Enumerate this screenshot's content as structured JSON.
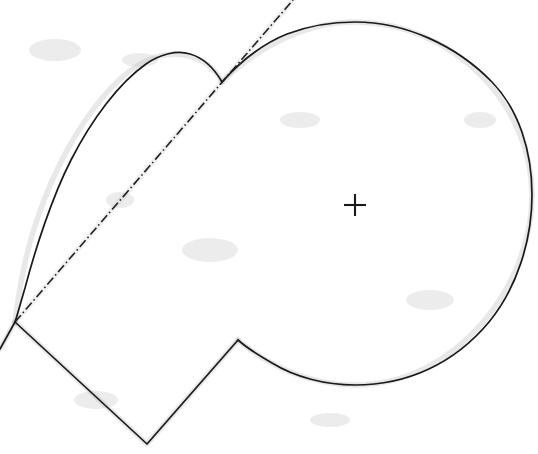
{
  "figure": {
    "title": "Limacon with tangent line, chord polyline and centre marker",
    "background_color": "#ffffff",
    "ink_color": "#1a1a1a",
    "halo_color": "#b9b9b9",
    "width": 538,
    "height": 454,
    "elements": [
      {
        "name": "large-circle-arc",
        "kind": "arc",
        "style": "solid",
        "description": "Large outer lobe running clockwise from the cusp at upper-left, over the top, down the right side and along the bottom to the polyline peak."
      },
      {
        "name": "small-lobe-arc",
        "kind": "arc",
        "style": "solid",
        "description": "Smaller inner lobe from the left vertex up over its apex and back down to the cusp."
      },
      {
        "name": "tangent-dash-dot-line",
        "kind": "line",
        "style": "dash-dot",
        "description": "Dash-dot straight line from the left vertex through the cusp continuing off the top edge."
      },
      {
        "name": "chord-polyline",
        "kind": "polyline",
        "style": "solid",
        "description": "Straight chain: left vertex down-right to the bottom V, up-right to the peak, then curving right into the big lobe."
      },
      {
        "name": "left-stub-segment",
        "kind": "line",
        "style": "solid",
        "description": "Short solid segment running from the left vertex down-left off the left edge."
      },
      {
        "name": "centre-cross-marker",
        "kind": "marker",
        "style": "plus",
        "description": "Small plus / cross marker inside the large lobe."
      }
    ],
    "points": [
      {
        "label": "cusp",
        "x": 222,
        "y": 82
      },
      {
        "label": "left-vertex",
        "x": 15,
        "y": 322
      },
      {
        "label": "lobe-apex",
        "x": 165,
        "y": 55
      },
      {
        "label": "circle-top",
        "x": 352,
        "y": 22
      },
      {
        "label": "circle-right",
        "x": 532,
        "y": 195
      },
      {
        "label": "circle-bottom",
        "x": 354,
        "y": 385
      },
      {
        "label": "polyline-valley",
        "x": 147,
        "y": 444
      },
      {
        "label": "polyline-peak",
        "x": 238,
        "y": 340
      },
      {
        "label": "centre-cross",
        "x": 355,
        "y": 205
      },
      {
        "label": "dash-dot-top",
        "x": 293,
        "y": 0
      },
      {
        "label": "left-stub-end",
        "x": 0,
        "y": 349
      }
    ],
    "geometry": {
      "large_lobe_centre_x": 355,
      "large_lobe_centre_y": 205,
      "large_lobe_radius": 180,
      "cross_arm_length": 11
    }
  }
}
